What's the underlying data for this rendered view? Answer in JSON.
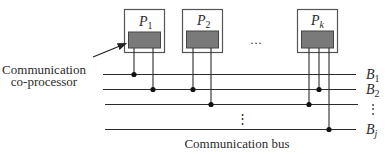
{
  "diagram": {
    "processors": [
      {
        "name": "P",
        "sub": "1"
      },
      {
        "name": "P",
        "sub": "2"
      },
      {
        "name": "P",
        "sub": "k"
      }
    ],
    "processor_ellipsis": "···",
    "buses": [
      {
        "name": "B",
        "sub": "1"
      },
      {
        "name": "B",
        "sub": "2"
      },
      {
        "name": "",
        "sub": ""
      },
      {
        "name": "B",
        "sub": "j"
      }
    ],
    "bus_label_ellipsis": "⋮",
    "bus_ellipsis": "⋮",
    "coprocessor_label_line1": "Communication",
    "coprocessor_label_line2": "co-processor",
    "bus_caption": "Communication bus",
    "colors": {
      "line": "#2b2b2b",
      "box_border": "#555555",
      "coprocessor_fill": "#7a7a7a",
      "dot": "#111111"
    }
  }
}
